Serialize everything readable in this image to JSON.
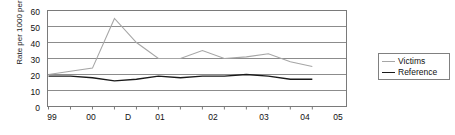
{
  "chart_data": {
    "type": "line",
    "title": "",
    "xlabel": "",
    "ylabel": "Rate per 1000 per 6 months",
    "ylim": [
      0,
      60
    ],
    "yticks": [
      0,
      10,
      20,
      30,
      40,
      50,
      60
    ],
    "grid": true,
    "legend_position": "right",
    "x": [
      1,
      2,
      3,
      4,
      5,
      6,
      7,
      8,
      9,
      10,
      11,
      12,
      13
    ],
    "xtick_labels": [
      "99",
      "00",
      "D",
      "01",
      "02",
      "03",
      "04",
      "05"
    ],
    "xtick_label_positions": [
      1,
      2.7,
      4.3,
      5.7,
      8,
      10.2,
      12,
      13.4
    ],
    "series": [
      {
        "name": "Victims",
        "color": "#a6a6a6",
        "values": [
          20,
          22,
          24,
          55,
          40,
          30,
          30,
          35,
          30,
          31,
          33,
          28,
          25
        ]
      },
      {
        "name": "Reference",
        "color": "#1a1a1a",
        "values": [
          19,
          19,
          18,
          16,
          17,
          19,
          18,
          19,
          19,
          20,
          19,
          17,
          17
        ]
      }
    ]
  },
  "axis": {
    "y_title": "Rate per 1000 per 6 months",
    "y_labels": [
      "60",
      "50",
      "40",
      "30",
      "20",
      "10",
      "0"
    ],
    "x_labels": [
      "99",
      "00",
      "D",
      "01",
      "02",
      "03",
      "04",
      "05"
    ]
  },
  "legend": {
    "items": [
      {
        "label": "Victims",
        "color": "#a6a6a6"
      },
      {
        "label": "Reference",
        "color": "#1a1a1a"
      }
    ]
  },
  "colors": {
    "victims": "#a6a6a6",
    "reference": "#1a1a1a",
    "gridline": "#8c8c8c",
    "frame": "#7a7a7a",
    "background": "#ffffff"
  }
}
